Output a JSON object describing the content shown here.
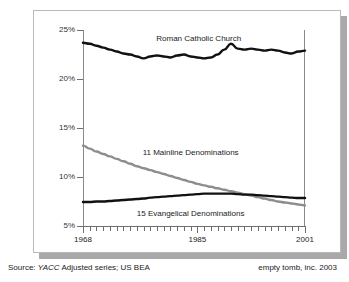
{
  "chart_data": {
    "type": "line",
    "title": "",
    "subtitle": "",
    "xlabel": "",
    "ylabel": "",
    "xlim": [
      1968,
      2001
    ],
    "ylim": [
      5,
      25
    ],
    "ytick_labels": [
      "25%",
      "20%",
      "15%",
      "10%",
      "5%"
    ],
    "ytick_values": [
      25,
      20,
      15,
      10,
      5
    ],
    "xtick_labels": [
      "1968",
      "1985",
      "2001"
    ],
    "xtick_values": [
      1968,
      1985,
      2001
    ],
    "grid": true,
    "grid_step": 1,
    "legend_position": "inline-annotations",
    "x": [
      1968,
      1969,
      1970,
      1971,
      1972,
      1973,
      1974,
      1975,
      1976,
      1977,
      1978,
      1979,
      1980,
      1981,
      1982,
      1983,
      1984,
      1985,
      1986,
      1987,
      1988,
      1989,
      1990,
      1991,
      1992,
      1993,
      1994,
      1995,
      1996,
      1997,
      1998,
      1999,
      2000,
      2001
    ],
    "series": [
      {
        "name": "Roman Catholic Church",
        "color": "#111111",
        "width": 2.4,
        "label_x": 1985.2,
        "label_y": 24.2,
        "values": [
          23.7,
          23.6,
          23.4,
          23.2,
          23.0,
          22.8,
          22.6,
          22.5,
          22.3,
          22.1,
          22.3,
          22.4,
          22.3,
          22.2,
          22.4,
          22.5,
          22.3,
          22.2,
          22.1,
          22.2,
          22.5,
          23.0,
          23.6,
          23.1,
          23.0,
          23.1,
          23.0,
          22.9,
          23.0,
          22.9,
          22.7,
          22.6,
          22.8,
          22.9
        ]
      },
      {
        "name": "11 Mainline Denominations",
        "color": "#8d8d8d",
        "width": 2.4,
        "label_x": 1984.0,
        "label_y": 12.6,
        "values": [
          13.2,
          12.9,
          12.6,
          12.35,
          12.1,
          11.85,
          11.6,
          11.35,
          11.1,
          10.9,
          10.7,
          10.5,
          10.3,
          10.1,
          9.9,
          9.7,
          9.5,
          9.3,
          9.15,
          9.0,
          8.85,
          8.7,
          8.55,
          8.4,
          8.25,
          8.1,
          7.95,
          7.8,
          7.65,
          7.5,
          7.4,
          7.3,
          7.2,
          7.1
        ]
      },
      {
        "name": "15 Evangelical Denominations",
        "color": "#111111",
        "width": 2.4,
        "label_x": 1984.0,
        "label_y": 6.35,
        "values": [
          7.45,
          7.45,
          7.5,
          7.5,
          7.55,
          7.6,
          7.65,
          7.7,
          7.75,
          7.8,
          7.9,
          7.95,
          8.0,
          8.05,
          8.1,
          8.15,
          8.2,
          8.25,
          8.3,
          8.3,
          8.3,
          8.3,
          8.3,
          8.25,
          8.2,
          8.2,
          8.15,
          8.1,
          8.05,
          8.0,
          7.95,
          7.9,
          7.85,
          7.85
        ]
      }
    ]
  },
  "footer": {
    "source_prefix": "Source:",
    "source_italic": "YACC",
    "source_rest": "Adjusted series; US BEA",
    "credit": "empty tomb, inc. 2003"
  },
  "colors": {
    "catholic_line": "#111111",
    "mainline_line": "#8d8d8d",
    "evangelical_line": "#111111",
    "axis": "#6f6f6f",
    "grid": "#ededed",
    "panel_border": "#b9b9b9",
    "shadow": "#a9a9a9"
  }
}
